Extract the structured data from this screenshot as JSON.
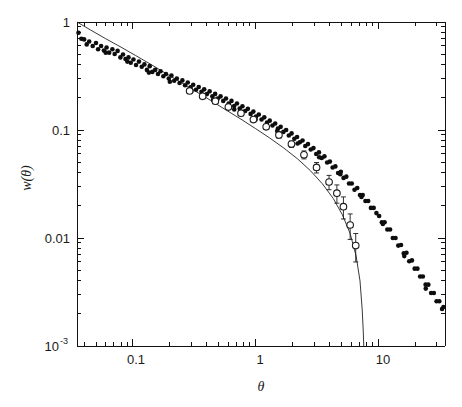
{
  "figure": {
    "title": "",
    "xlabel": "θ",
    "ylabel": "w(θ)"
  },
  "axes": {
    "x_ticklabels": [
      "0.1",
      "1",
      "10"
    ],
    "y_ticklabels": [
      "1",
      "0.1",
      "0.01",
      "10"
    ],
    "y_bottom_exponent": "-3"
  },
  "chart_data": {
    "type": "scatter",
    "title": "",
    "xlabel": "θ",
    "ylabel": "w(θ)",
    "xscale": "log",
    "yscale": "log",
    "xlim": [
      0.035,
      35.0
    ],
    "ylim": [
      0.001,
      1.0
    ],
    "grid": false,
    "legend": "none",
    "x_major_ticks": [
      0.1,
      1,
      10
    ],
    "y_major_ticks": [
      1,
      0.1,
      0.01,
      0.001
    ],
    "series": [
      {
        "name": "filled-circles",
        "marker": "filled circle",
        "color": "#0d0d0d",
        "points": [
          [
            0.036,
            0.795
          ],
          [
            0.038,
            0.7
          ],
          [
            0.04,
            0.69
          ],
          [
            0.042,
            0.62
          ],
          [
            0.044,
            0.66
          ],
          [
            0.047,
            0.6
          ],
          [
            0.05,
            0.64
          ],
          [
            0.052,
            0.56
          ],
          [
            0.055,
            0.6
          ],
          [
            0.058,
            0.545
          ],
          [
            0.061,
            0.58
          ],
          [
            0.064,
            0.52
          ],
          [
            0.068,
            0.56
          ],
          [
            0.071,
            0.505
          ],
          [
            0.075,
            0.54
          ],
          [
            0.079,
            0.47
          ],
          [
            0.083,
            0.5
          ],
          [
            0.087,
            0.455
          ],
          [
            0.092,
            0.47
          ],
          [
            0.096,
            0.42
          ],
          [
            0.101,
            0.45
          ],
          [
            0.106,
            0.4
          ],
          [
            0.112,
            0.43
          ],
          [
            0.118,
            0.385
          ],
          [
            0.124,
            0.405
          ],
          [
            0.13,
            0.36
          ],
          [
            0.137,
            0.39
          ],
          [
            0.144,
            0.345
          ],
          [
            0.152,
            0.36
          ],
          [
            0.16,
            0.33
          ],
          [
            0.168,
            0.35
          ],
          [
            0.177,
            0.315
          ],
          [
            0.186,
            0.33
          ],
          [
            0.196,
            0.3
          ],
          [
            0.206,
            0.32
          ],
          [
            0.217,
            0.286
          ],
          [
            0.228,
            0.3
          ],
          [
            0.24,
            0.272
          ],
          [
            0.253,
            0.288
          ],
          [
            0.266,
            0.26
          ],
          [
            0.28,
            0.275
          ],
          [
            0.295,
            0.248
          ],
          [
            0.31,
            0.262
          ],
          [
            0.327,
            0.236
          ],
          [
            0.344,
            0.25
          ],
          [
            0.362,
            0.226
          ],
          [
            0.381,
            0.238
          ],
          [
            0.401,
            0.215
          ],
          [
            0.422,
            0.228
          ],
          [
            0.444,
            0.205
          ],
          [
            0.468,
            0.216
          ],
          [
            0.492,
            0.196
          ],
          [
            0.518,
            0.205
          ],
          [
            0.545,
            0.186
          ],
          [
            0.574,
            0.196
          ],
          [
            0.604,
            0.176
          ],
          [
            0.636,
            0.186
          ],
          [
            0.669,
            0.167
          ],
          [
            0.705,
            0.176
          ],
          [
            0.742,
            0.158
          ],
          [
            0.781,
            0.166
          ],
          [
            0.822,
            0.15
          ],
          [
            0.865,
            0.157
          ],
          [
            0.911,
            0.141
          ],
          [
            0.959,
            0.148
          ],
          [
            1.009,
            0.133
          ],
          [
            1.062,
            0.139
          ],
          [
            1.118,
            0.125
          ],
          [
            1.177,
            0.131
          ],
          [
            1.239,
            0.117
          ],
          [
            1.304,
            0.122
          ],
          [
            1.373,
            0.11
          ],
          [
            1.445,
            0.115
          ],
          [
            1.521,
            0.103
          ],
          [
            1.601,
            0.107
          ],
          [
            1.685,
            0.096
          ],
          [
            1.774,
            0.1
          ],
          [
            1.867,
            0.089
          ],
          [
            1.965,
            0.093
          ],
          [
            2.069,
            0.083
          ],
          [
            2.178,
            0.086
          ],
          [
            2.293,
            0.077
          ],
          [
            2.414,
            0.08
          ],
          [
            2.541,
            0.071
          ],
          [
            2.675,
            0.074
          ],
          [
            2.816,
            0.066
          ],
          [
            2.964,
            0.068
          ],
          [
            3.12,
            0.06
          ],
          [
            3.285,
            0.062
          ],
          [
            3.458,
            0.055
          ],
          [
            3.64,
            0.057
          ],
          [
            3.832,
            0.05
          ],
          [
            4.034,
            0.051
          ],
          [
            4.246,
            0.045
          ],
          [
            4.47,
            0.046
          ],
          [
            4.705,
            0.04
          ],
          [
            4.953,
            0.041
          ],
          [
            5.214,
            0.036
          ],
          [
            5.489,
            0.037
          ],
          [
            5.778,
            0.032
          ],
          [
            6.083,
            0.032
          ],
          [
            6.403,
            0.028
          ],
          [
            6.741,
            0.029
          ],
          [
            7.096,
            0.025
          ],
          [
            7.47,
            0.025
          ],
          [
            7.863,
            0.022
          ],
          [
            8.277,
            0.022
          ],
          [
            8.713,
            0.019
          ],
          [
            9.172,
            0.019
          ],
          [
            9.656,
            0.017
          ],
          [
            10.165,
            0.016
          ],
          [
            10.7,
            0.014
          ],
          [
            11.264,
            0.014
          ],
          [
            11.857,
            0.012
          ],
          [
            12.482,
            0.012
          ],
          [
            13.14,
            0.01
          ],
          [
            13.832,
            0.01
          ],
          [
            14.56,
            0.0085
          ],
          [
            15.327,
            0.0086
          ],
          [
            16.134,
            0.0072
          ],
          [
            16.984,
            0.0073
          ],
          [
            17.879,
            0.0061
          ],
          [
            18.821,
            0.0062
          ],
          [
            19.812,
            0.0052
          ],
          [
            20.856,
            0.0052
          ],
          [
            21.954,
            0.0044
          ],
          [
            23.111,
            0.0044
          ],
          [
            24.328,
            0.0037
          ],
          [
            25.61,
            0.0037
          ],
          [
            26.959,
            0.0031
          ],
          [
            28.379,
            0.0031
          ],
          [
            29.874,
            0.0026
          ],
          [
            31.447,
            0.0026
          ],
          [
            33.103,
            0.0022
          ],
          [
            34.0,
            0.0023
          ],
          [
            0.06,
            0.52
          ],
          [
            0.09,
            0.43
          ],
          [
            0.135,
            0.34
          ],
          [
            0.2,
            0.28
          ],
          [
            0.3,
            0.23
          ],
          [
            0.45,
            0.19
          ],
          [
            0.67,
            0.155
          ],
          [
            1.0,
            0.125
          ],
          [
            1.5,
            0.098
          ],
          [
            2.2,
            0.075
          ],
          [
            3.3,
            0.056
          ],
          [
            4.9,
            0.039
          ],
          [
            7.3,
            0.024
          ],
          [
            10.9,
            0.0135
          ],
          [
            16.3,
            0.0068
          ],
          [
            24.4,
            0.0034
          ]
        ]
      },
      {
        "name": "open-circles",
        "marker": "open circle with error bar",
        "color": "#1a1a1a",
        "points": [
          [
            0.29,
            0.23
          ],
          [
            0.37,
            0.205
          ],
          [
            0.47,
            0.185
          ],
          [
            0.6,
            0.163
          ],
          [
            0.76,
            0.143
          ],
          [
            0.96,
            0.125
          ],
          [
            1.22,
            0.107
          ],
          [
            1.55,
            0.09
          ],
          [
            1.96,
            0.074
          ],
          [
            2.48,
            0.059
          ],
          [
            3.14,
            0.045
          ],
          [
            3.97,
            0.033
          ],
          [
            4.6,
            0.026
          ],
          [
            5.2,
            0.0195
          ],
          [
            5.9,
            0.0132
          ],
          [
            6.55,
            0.0085
          ]
        ],
        "errors": [
          0.008,
          0.008,
          0.008,
          0.007,
          0.007,
          0.006,
          0.006,
          0.006,
          0.005,
          0.005,
          0.005,
          0.005,
          0.005,
          0.0045,
          0.0035,
          0.0025
        ]
      },
      {
        "name": "model-curve",
        "marker": "solid line",
        "color": "#222222",
        "points": [
          [
            0.035,
            1.0
          ],
          [
            0.045,
            0.845
          ],
          [
            0.06,
            0.7
          ],
          [
            0.08,
            0.585
          ],
          [
            0.105,
            0.49
          ],
          [
            0.14,
            0.405
          ],
          [
            0.185,
            0.335
          ],
          [
            0.245,
            0.277
          ],
          [
            0.325,
            0.228
          ],
          [
            0.43,
            0.188
          ],
          [
            0.57,
            0.154
          ],
          [
            0.76,
            0.126
          ],
          [
            1.0,
            0.103
          ],
          [
            1.3,
            0.0845
          ],
          [
            1.7,
            0.068
          ],
          [
            2.2,
            0.054
          ],
          [
            2.8,
            0.042
          ],
          [
            3.5,
            0.0318
          ],
          [
            4.3,
            0.0232
          ],
          [
            5.1,
            0.0164
          ],
          [
            5.9,
            0.011
          ],
          [
            6.6,
            0.0068
          ],
          [
            7.1,
            0.004
          ],
          [
            7.4,
            0.00215
          ],
          [
            7.55,
            0.00135
          ],
          [
            7.62,
            0.001
          ]
        ]
      }
    ]
  }
}
